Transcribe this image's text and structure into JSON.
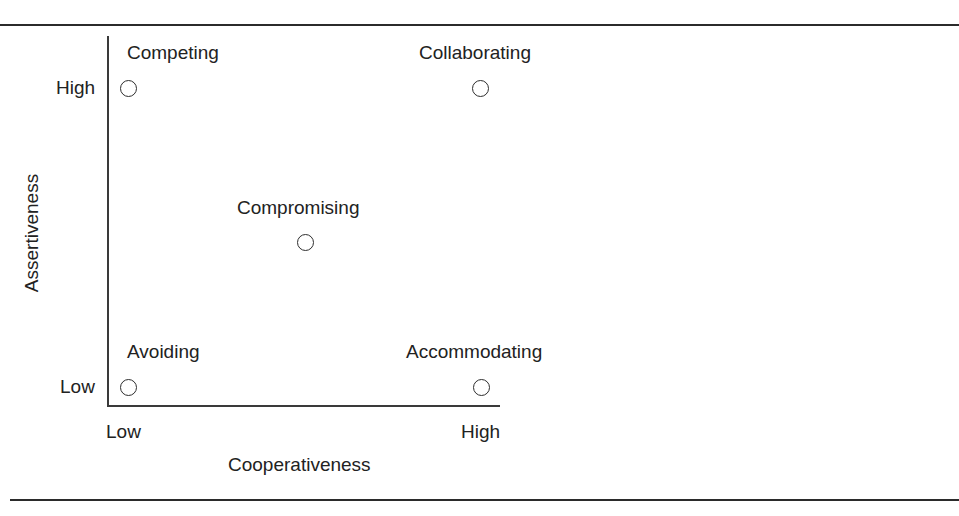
{
  "figure": {
    "background_color": "#ffffff",
    "line_color": "#2b2b2b",
    "text_color": "#222222"
  },
  "axes": {
    "y": {
      "title": "Assertiveness",
      "ticks": {
        "high": "High",
        "low": "Low"
      }
    },
    "x": {
      "title": "Cooperativeness",
      "ticks": {
        "low": "Low",
        "high": "High"
      }
    }
  },
  "nodes": [
    {
      "label": "Competing",
      "x": "Low",
      "y": "High"
    },
    {
      "label": "Collaborating",
      "x": "High",
      "y": "High"
    },
    {
      "label": "Compromising",
      "x": "Medium",
      "y": "Medium"
    },
    {
      "label": "Avoiding",
      "x": "Low",
      "y": "Low"
    },
    {
      "label": "Accommodating",
      "x": "High",
      "y": "Low"
    }
  ],
  "chart_data": {
    "type": "scatter",
    "title": "",
    "xlabel": "Cooperativeness",
    "ylabel": "Assertiveness",
    "xlim": [
      0,
      1
    ],
    "ylim": [
      0,
      1
    ],
    "xticks": [
      0,
      1
    ],
    "xticklabels": [
      "Low",
      "High"
    ],
    "yticks": [
      0,
      1
    ],
    "yticklabels": [
      "Low",
      "High"
    ],
    "grid": false,
    "legend": "none",
    "marker_style": "open-circle",
    "points": [
      {
        "label": "Competing",
        "x": 0.05,
        "y": 1.0,
        "label_position": "above"
      },
      {
        "label": "Collaborating",
        "x": 0.95,
        "y": 1.0,
        "label_position": "above"
      },
      {
        "label": "Compromising",
        "x": 0.5,
        "y": 0.5,
        "label_position": "above"
      },
      {
        "label": "Avoiding",
        "x": 0.05,
        "y": 0.0,
        "label_position": "above"
      },
      {
        "label": "Accommodating",
        "x": 0.95,
        "y": 0.0,
        "label_position": "above"
      }
    ]
  }
}
